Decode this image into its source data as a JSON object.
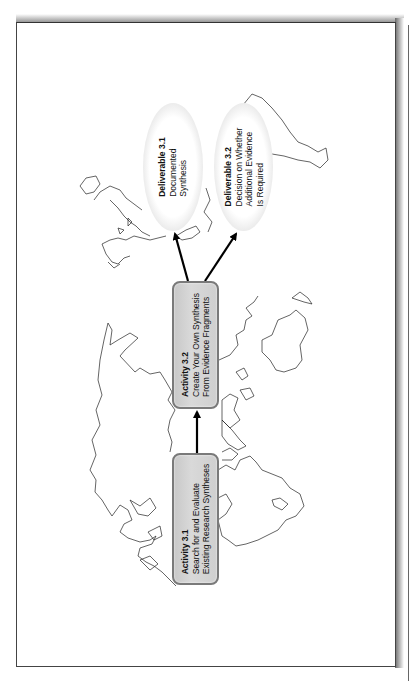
{
  "diagram": {
    "orientation": "rotated-90-ccw",
    "background": "world-map-outline",
    "nodes": [
      {
        "id": "activity-3-1",
        "type": "rounded-box",
        "title": "Activity 3.1",
        "lines": [
          "Search for and Evaluate",
          "Existing Research Syntheses"
        ]
      },
      {
        "id": "activity-3-2",
        "type": "rounded-box",
        "title": "Activity 3.2",
        "lines": [
          "Create Your Own Synthesis",
          "From Evidence Fragments"
        ]
      },
      {
        "id": "deliverable-3-1",
        "type": "ellipse",
        "title": "Deliverable 3.1",
        "lines": [
          "Documented",
          "Synthesis"
        ]
      },
      {
        "id": "deliverable-3-2",
        "type": "ellipse",
        "title": "Deliverable 3.2",
        "lines": [
          "Decision on Whether",
          "Additional Evidence",
          "Is Required"
        ]
      }
    ],
    "edges": [
      {
        "from": "Activity 3.1",
        "to": "Activity 3.2"
      },
      {
        "from": "Activity 3.2",
        "to": "Deliverable 3.1"
      },
      {
        "from": "Activity 3.2",
        "to": "Deliverable 3.2"
      }
    ],
    "colors": {
      "box_fill": "#d0d0d0",
      "box_border": "#7a7a7a",
      "arrow": "#000000",
      "map_outline": "#222222"
    }
  }
}
